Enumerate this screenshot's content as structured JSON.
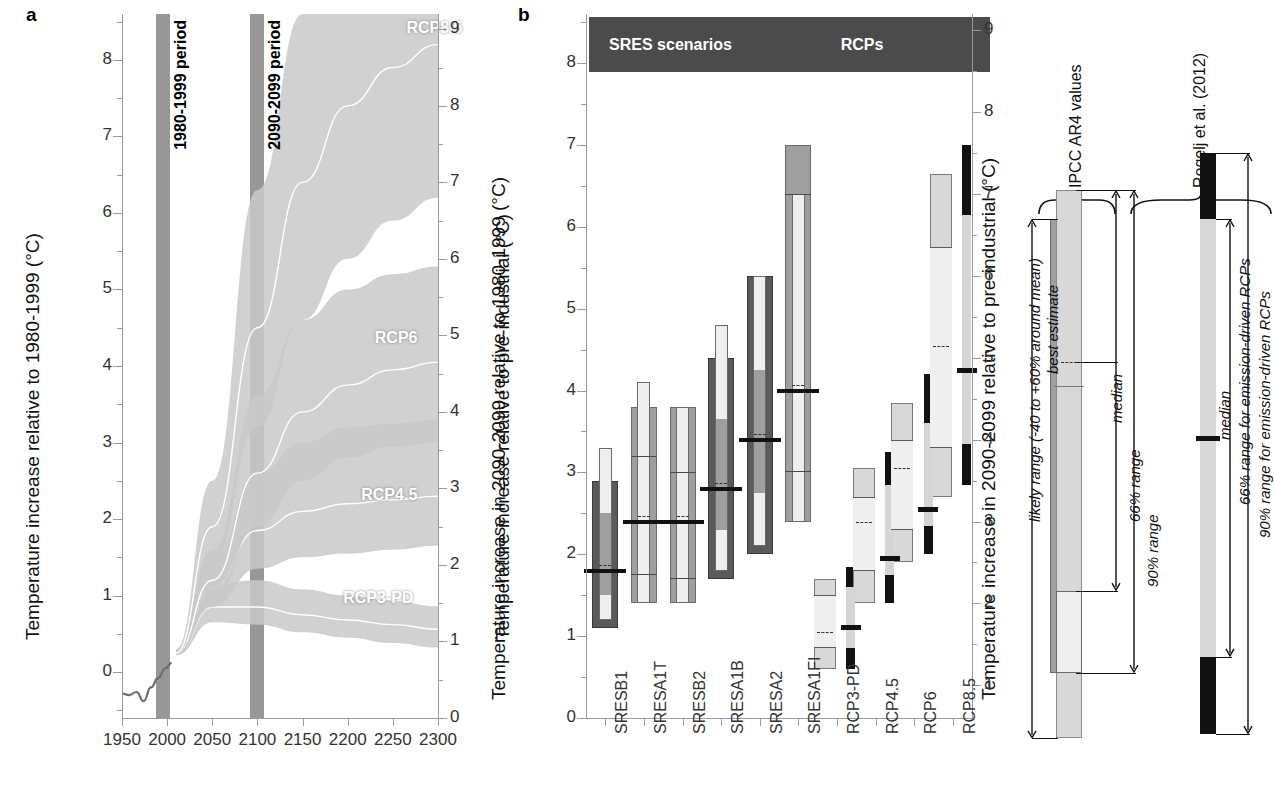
{
  "figure": {
    "panel_a_letter": "a",
    "panel_b_letter": "b"
  },
  "chart_data": [
    {
      "type": "area",
      "panel": "a",
      "title": "",
      "xlabel": "",
      "ylabel": "Temperature increase relative to 1980-1999 (°C)",
      "ylabel_right": "Temperature increase relative to pre-industrial (°C)",
      "xlim": [
        1950,
        2300
      ],
      "ylim": [
        -0.6,
        8.6
      ],
      "ylim_right": [
        0.0,
        9.0
      ],
      "xticks": [
        1950,
        2000,
        2050,
        2100,
        2150,
        2200,
        2250,
        2300
      ],
      "yticks": [
        0,
        1,
        2,
        3,
        4,
        5,
        6,
        7,
        8
      ],
      "yticks_right": [
        0,
        1,
        2,
        3,
        4,
        5,
        6,
        7,
        8,
        9
      ],
      "grid": false,
      "shaded_periods": [
        {
          "label": "1980-1999 period",
          "start": 1988,
          "end": 2003
        },
        {
          "label": "2090-2099 period",
          "start": 2092,
          "end": 2107
        }
      ],
      "series": [
        {
          "name": "RCP8.5",
          "label_x": 2265,
          "label_y": 8.4,
          "median": [
            {
              "x": 2010,
              "y": 0.25
            },
            {
              "x": 2050,
              "y": 1.9
            },
            {
              "x": 2100,
              "y": 4.5
            },
            {
              "x": 2150,
              "y": 6.4
            },
            {
              "x": 2200,
              "y": 7.4
            },
            {
              "x": 2250,
              "y": 7.9
            },
            {
              "x": 2300,
              "y": 8.2
            }
          ],
          "low": [
            {
              "x": 2010,
              "y": 0.22
            },
            {
              "x": 2050,
              "y": 1.4
            },
            {
              "x": 2100,
              "y": 3.2
            },
            {
              "x": 2150,
              "y": 4.6
            },
            {
              "x": 2200,
              "y": 5.4
            },
            {
              "x": 2250,
              "y": 5.9
            },
            {
              "x": 2300,
              "y": 6.2
            }
          ],
          "high": [
            {
              "x": 2010,
              "y": 0.3
            },
            {
              "x": 2050,
              "y": 2.5
            },
            {
              "x": 2100,
              "y": 6.3
            },
            {
              "x": 2150,
              "y": 8.6
            },
            {
              "x": 2200,
              "y": 8.8
            },
            {
              "x": 2250,
              "y": 8.9
            },
            {
              "x": 2300,
              "y": 9.0
            }
          ]
        },
        {
          "name": "RCP6",
          "label_x": 2230,
          "label_y": 4.35,
          "median": [
            {
              "x": 2010,
              "y": 0.25
            },
            {
              "x": 2050,
              "y": 1.2
            },
            {
              "x": 2100,
              "y": 2.6
            },
            {
              "x": 2150,
              "y": 3.4
            },
            {
              "x": 2200,
              "y": 3.75
            },
            {
              "x": 2250,
              "y": 3.95
            },
            {
              "x": 2300,
              "y": 4.05
            }
          ],
          "low": [
            {
              "x": 2010,
              "y": 0.22
            },
            {
              "x": 2050,
              "y": 0.9
            },
            {
              "x": 2100,
              "y": 1.9
            },
            {
              "x": 2150,
              "y": 2.5
            },
            {
              "x": 2200,
              "y": 2.8
            },
            {
              "x": 2250,
              "y": 2.95
            },
            {
              "x": 2300,
              "y": 3.0
            }
          ],
          "high": [
            {
              "x": 2010,
              "y": 0.3
            },
            {
              "x": 2050,
              "y": 1.6
            },
            {
              "x": 2100,
              "y": 3.6
            },
            {
              "x": 2150,
              "y": 4.6
            },
            {
              "x": 2200,
              "y": 5.0
            },
            {
              "x": 2250,
              "y": 5.2
            },
            {
              "x": 2300,
              "y": 5.3
            }
          ]
        },
        {
          "name": "RCP4.5",
          "label_x": 2215,
          "label_y": 2.3,
          "median": [
            {
              "x": 2010,
              "y": 0.25
            },
            {
              "x": 2050,
              "y": 1.1
            },
            {
              "x": 2100,
              "y": 1.85
            },
            {
              "x": 2150,
              "y": 2.1
            },
            {
              "x": 2200,
              "y": 2.2
            },
            {
              "x": 2250,
              "y": 2.25
            },
            {
              "x": 2300,
              "y": 2.3
            }
          ],
          "low": [
            {
              "x": 2010,
              "y": 0.22
            },
            {
              "x": 2050,
              "y": 0.85
            },
            {
              "x": 2100,
              "y": 1.35
            },
            {
              "x": 2150,
              "y": 1.5
            },
            {
              "x": 2200,
              "y": 1.55
            },
            {
              "x": 2250,
              "y": 1.6
            },
            {
              "x": 2300,
              "y": 1.65
            }
          ],
          "high": [
            {
              "x": 2010,
              "y": 0.3
            },
            {
              "x": 2050,
              "y": 1.45
            },
            {
              "x": 2100,
              "y": 2.6
            },
            {
              "x": 2150,
              "y": 3.0
            },
            {
              "x": 2200,
              "y": 3.2
            },
            {
              "x": 2250,
              "y": 3.25
            },
            {
              "x": 2300,
              "y": 3.3
            }
          ]
        },
        {
          "name": "RCP3-PD",
          "label_x": 2195,
          "label_y": 0.95,
          "median": [
            {
              "x": 2010,
              "y": 0.25
            },
            {
              "x": 2050,
              "y": 0.85
            },
            {
              "x": 2100,
              "y": 0.85
            },
            {
              "x": 2150,
              "y": 0.75
            },
            {
              "x": 2200,
              "y": 0.68
            },
            {
              "x": 2250,
              "y": 0.62
            },
            {
              "x": 2300,
              "y": 0.56
            }
          ],
          "low": [
            {
              "x": 2010,
              "y": 0.22
            },
            {
              "x": 2050,
              "y": 0.65
            },
            {
              "x": 2100,
              "y": 0.62
            },
            {
              "x": 2150,
              "y": 0.52
            },
            {
              "x": 2200,
              "y": 0.45
            },
            {
              "x": 2250,
              "y": 0.38
            },
            {
              "x": 2300,
              "y": 0.32
            }
          ],
          "high": [
            {
              "x": 2010,
              "y": 0.3
            },
            {
              "x": 2050,
              "y": 1.15
            },
            {
              "x": 2100,
              "y": 1.2
            },
            {
              "x": 2150,
              "y": 1.08
            },
            {
              "x": 2200,
              "y": 1.0
            },
            {
              "x": 2250,
              "y": 0.93
            },
            {
              "x": 2300,
              "y": 0.86
            }
          ]
        }
      ],
      "observed": {
        "name": "historical observations",
        "points": [
          {
            "x": 1950,
            "y": -0.28
          },
          {
            "x": 1958,
            "y": -0.3
          },
          {
            "x": 1966,
            "y": -0.26
          },
          {
            "x": 1974,
            "y": -0.38
          },
          {
            "x": 1982,
            "y": -0.2
          },
          {
            "x": 1990,
            "y": -0.08
          },
          {
            "x": 1998,
            "y": 0.05
          },
          {
            "x": 2005,
            "y": 0.12
          }
        ]
      }
    },
    {
      "type": "bar",
      "panel": "b",
      "title": "",
      "ylabel": "Temperature increase in 2090-2099 relative to 1980-1999 (°C)",
      "ylabel_right": "Temperature increase in 2090-2099 relative to pre-industrial (°C)",
      "ylim": [
        0,
        8.6
      ],
      "ylim_right": [
        0.6,
        9.2
      ],
      "yticks": [
        0,
        1,
        2,
        3,
        4,
        5,
        6,
        7,
        8
      ],
      "yticks_right": [
        0,
        1,
        2,
        3,
        4,
        5,
        6,
        7,
        8,
        9
      ],
      "grid": false,
      "group_headers": [
        {
          "label": "SRES scenarios",
          "first": 0,
          "last": 5
        },
        {
          "label": "RCPs",
          "first": 6,
          "last": 9
        }
      ],
      "categories": [
        "SRESB1",
        "SRESA1T",
        "SRESB2",
        "SRESA1B",
        "SRESA2",
        "SRESA1FI",
        "RCP3-PD",
        "RCP4.5",
        "RCP6",
        "RCP8.5"
      ],
      "bars": [
        {
          "name": "SRESB1",
          "style": "ar4",
          "ar4_low": 1.1,
          "ar4_high": 2.9,
          "best_estimate": 1.8,
          "inner_low": 1.2,
          "inner_high": 1.5,
          "inner_top_low": 2.5,
          "inner_top_high": 3.3,
          "median": 1.8
        },
        {
          "name": "SRESA1T",
          "style": "rogelj",
          "rog_90_low": 1.4,
          "rog_90_high": 3.8,
          "rog_66_low": 1.75,
          "rog_66_high": 3.2,
          "median": 2.4,
          "ar4_low": 1.4,
          "ar4_high": 4.1,
          "best_estimate": 2.4
        },
        {
          "name": "SRESB2",
          "style": "rogelj",
          "rog_90_low": 1.4,
          "rog_90_high": 3.8,
          "rog_66_low": 1.7,
          "rog_66_high": 3.0,
          "median": 2.4,
          "ar4_low": 1.4,
          "ar4_high": 3.8,
          "best_estimate": 2.4
        },
        {
          "name": "SRESA1B",
          "style": "ar4",
          "ar4_low": 1.7,
          "ar4_high": 4.4,
          "best_estimate": 2.8,
          "inner_low": 1.8,
          "inner_high": 2.3,
          "inner_top_low": 3.65,
          "inner_top_high": 4.8,
          "median": 2.8
        },
        {
          "name": "SRESA2",
          "style": "ar4",
          "ar4_low": 2.0,
          "ar4_high": 5.4,
          "best_estimate": 3.4,
          "inner_low": 2.1,
          "inner_high": 2.75,
          "inner_top_low": 4.25,
          "inner_top_high": 5.4,
          "median": 3.4
        },
        {
          "name": "SRESA1FI",
          "style": "rogelj",
          "rog_90_low": 2.4,
          "rog_90_high": 7.0,
          "rog_66_low": 3.0,
          "rog_66_high": 6.4,
          "median": 4.0,
          "ar4_low": 2.4,
          "ar4_high": 6.4,
          "best_estimate": 4.0
        },
        {
          "name": "RCP3-PD",
          "style": "rcp",
          "box_low": 0.6,
          "box_high": 1.7,
          "box66_low": 0.85,
          "box66_high": 1.5,
          "median": 1.05,
          "blk_low": 0.6,
          "blk_high": 1.85,
          "blk66_low": 0.85,
          "blk66_high": 1.6,
          "blk_median": 1.1
        },
        {
          "name": "RCP4.5",
          "style": "rcp",
          "box_low": 1.4,
          "box_high": 3.05,
          "box66_low": 1.8,
          "box66_high": 2.7,
          "median": 2.4,
          "blk_low": 1.4,
          "blk_high": 3.25,
          "blk66_low": 1.75,
          "blk66_high": 2.85,
          "blk_median": 1.95
        },
        {
          "name": "RCP6",
          "style": "rcp",
          "box_low": 1.9,
          "box_high": 3.85,
          "box66_low": 2.3,
          "box66_high": 3.4,
          "median": 3.05,
          "blk_low": 2.0,
          "blk_high": 4.2,
          "blk66_low": 2.35,
          "blk66_high": 3.6,
          "blk_median": 2.55
        },
        {
          "name": "RCP8.5",
          "style": "rcp",
          "box_low": 2.7,
          "box_high": 6.65,
          "box66_low": 3.3,
          "box66_high": 5.75,
          "median": 4.55,
          "blk_low": 2.85,
          "blk_high": 7.0,
          "blk66_low": 3.35,
          "blk66_high": 6.15,
          "blk_median": 4.25
        }
      ]
    }
  ],
  "legend_panel": {
    "groups": [
      {
        "label": "IPCC AR4 values"
      },
      {
        "label": "Rogelj et al. (2012)"
      }
    ],
    "ar4_annotations": [
      {
        "label": "likely range (-40 to +60% around mean)"
      },
      {
        "label": "best estimate"
      },
      {
        "label": "median"
      },
      {
        "label": "66% range"
      },
      {
        "label": "90% range"
      }
    ],
    "rogelj_annotations": [
      {
        "label": "median"
      },
      {
        "label": "66% range for emission-driven RCPs"
      },
      {
        "label": "90% range for emission-driven RCPs"
      }
    ]
  },
  "colors": {
    "band_light": "#c9c9c9",
    "band_mid": "#b0b0b0",
    "band_dark": "#8e8e8e",
    "header_bg": "#4b4b4b",
    "box_dark": "#5a5a5a",
    "box_mid": "#9f9f9f",
    "box_light": "#d8d8d8",
    "box_pale": "#efefef",
    "black": "#111111",
    "axis": "#9a9a9a"
  }
}
